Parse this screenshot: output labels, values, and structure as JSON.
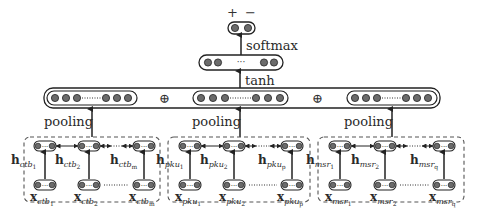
{
  "diagram": {
    "type": "neural-network-architecture",
    "output": {
      "classes": [
        "+",
        "−"
      ],
      "activation_label": "softmax"
    },
    "hidden": {
      "activation_label": "tanh"
    },
    "concat_symbol": "⊕",
    "pooling_label": "pooling",
    "groups": [
      {
        "id": "ctb",
        "h_prefix": "h",
        "x_prefix": "x",
        "subscript": "ctb",
        "indices": [
          "1",
          "2",
          "m"
        ]
      },
      {
        "id": "pku",
        "h_prefix": "h",
        "x_prefix": "x",
        "subscript": "pku",
        "indices": [
          "1",
          "2",
          "p"
        ]
      },
      {
        "id": "msr",
        "h_prefix": "h",
        "x_prefix": "x",
        "subscript": "msr",
        "indices": [
          "1",
          "2",
          "q"
        ]
      }
    ],
    "colors": {
      "node_fill": "#6b6b6b",
      "stroke": "#2a2a2a",
      "dashed_box": "#555555"
    }
  }
}
